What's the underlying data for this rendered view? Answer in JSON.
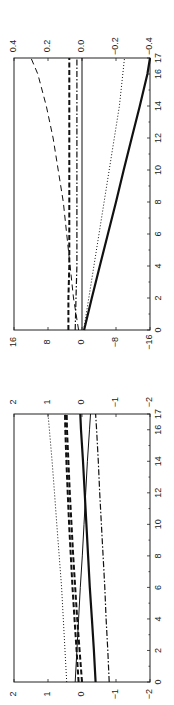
{
  "chart_data": [
    {
      "type": "line",
      "title": "",
      "orientation": "rotated-90 (x axis runs bottom-to-top, y positive to the left)",
      "xlabel": "",
      "ylabel": "",
      "xlim": [
        0,
        17
      ],
      "x_ticks": [
        0,
        2,
        4,
        6,
        8,
        10,
        12,
        14,
        16,
        17
      ],
      "ylim_left": [
        -16,
        16
      ],
      "y_ticks_left": [
        16,
        8,
        0,
        -8,
        -16
      ],
      "ylim_right": [
        -0.4,
        0.4
      ],
      "y_ticks_right": [
        "0.4",
        "0.2",
        "0.0",
        "-0.2",
        "-0.4"
      ],
      "grid": false,
      "x": [
        0,
        2,
        4,
        6,
        8,
        10,
        12,
        14,
        16,
        17
      ],
      "series": [
        {
          "name": "thick solid (left axis)",
          "style": "solid-thick",
          "axis": "left",
          "values": [
            -0.5,
            -2.3,
            -4.2,
            -6.1,
            -8.0,
            -9.8,
            -11.7,
            -13.6,
            -15.4,
            -16.0
          ]
        },
        {
          "name": "thin solid",
          "style": "solid-thin",
          "axis": "right",
          "values": [
            0,
            0,
            0,
            0,
            0,
            0,
            0,
            0,
            0,
            0
          ]
        },
        {
          "name": "dotted (right axis)",
          "style": "dotted",
          "axis": "right",
          "values": [
            -0.01,
            -0.04,
            -0.07,
            -0.1,
            -0.13,
            -0.16,
            -0.19,
            -0.22,
            -0.24,
            -0.25
          ]
        },
        {
          "name": "long dashed (right axis)",
          "style": "dashed-thin",
          "axis": "right",
          "values": [
            0.02,
            0.05,
            0.07,
            0.09,
            0.11,
            0.14,
            0.17,
            0.21,
            0.26,
            0.3
          ]
        },
        {
          "name": "thick dashed (right axis)",
          "style": "dashed-thick",
          "axis": "right",
          "values": [
            0.08,
            0.08,
            0.075,
            0.075,
            0.075,
            0.075,
            0.075,
            0.075,
            0.075,
            0.075
          ]
        },
        {
          "name": "dash-dot (right axis)",
          "style": "dashdot",
          "axis": "right",
          "values": [
            0.04,
            0.035,
            0.03,
            0.03,
            0.03,
            0.03,
            0.03,
            0.03,
            0.03,
            0.03
          ]
        }
      ]
    },
    {
      "type": "line",
      "title": "",
      "orientation": "rotated-90 (x axis runs bottom-to-top, y positive to the left)",
      "xlabel": "",
      "ylabel": "",
      "xlim": [
        0,
        17
      ],
      "x_ticks": [
        0,
        2,
        4,
        6,
        8,
        10,
        12,
        14,
        16,
        17
      ],
      "ylim_left": [
        -2,
        2
      ],
      "y_ticks_left": [
        2,
        1,
        0,
        -1,
        -2
      ],
      "ylim_right": [
        -2,
        2
      ],
      "y_ticks_right": [
        "2",
        "1",
        "0",
        "-1",
        "-2"
      ],
      "grid": false,
      "x": [
        0,
        2,
        4,
        6,
        8,
        10,
        12,
        14,
        16,
        17
      ],
      "series": [
        {
          "name": "dotted",
          "style": "dotted",
          "axis": "left",
          "values": [
            0.45,
            0.5,
            0.55,
            0.6,
            0.67,
            0.74,
            0.81,
            0.88,
            0.96,
            1.0
          ]
        },
        {
          "name": "thick dashed A",
          "style": "dashed-thick",
          "axis": "left",
          "values": [
            0.0,
            0.07,
            0.14,
            0.2,
            0.26,
            0.31,
            0.36,
            0.4,
            0.44,
            0.45
          ]
        },
        {
          "name": "thick dashed B",
          "style": "dashed-thick",
          "axis": "left",
          "values": [
            0.1,
            0.16,
            0.22,
            0.28,
            0.33,
            0.38,
            0.42,
            0.46,
            0.49,
            0.5
          ]
        },
        {
          "name": "thick solid",
          "style": "solid-thick",
          "axis": "left",
          "values": [
            -0.4,
            -0.35,
            -0.29,
            -0.23,
            -0.18,
            -0.13,
            -0.08,
            -0.03,
            0.03,
            0.05
          ]
        },
        {
          "name": "thin solid",
          "style": "solid-thin",
          "axis": "left",
          "values": [
            0.2,
            0.15,
            0.1,
            0.05,
            -0.01,
            -0.06,
            -0.11,
            -0.16,
            -0.22,
            -0.25
          ]
        },
        {
          "name": "dash-dot",
          "style": "dashdot",
          "axis": "left",
          "values": [
            -0.8,
            -0.76,
            -0.71,
            -0.67,
            -0.62,
            -0.57,
            -0.52,
            -0.48,
            -0.43,
            -0.4
          ]
        }
      ]
    }
  ]
}
